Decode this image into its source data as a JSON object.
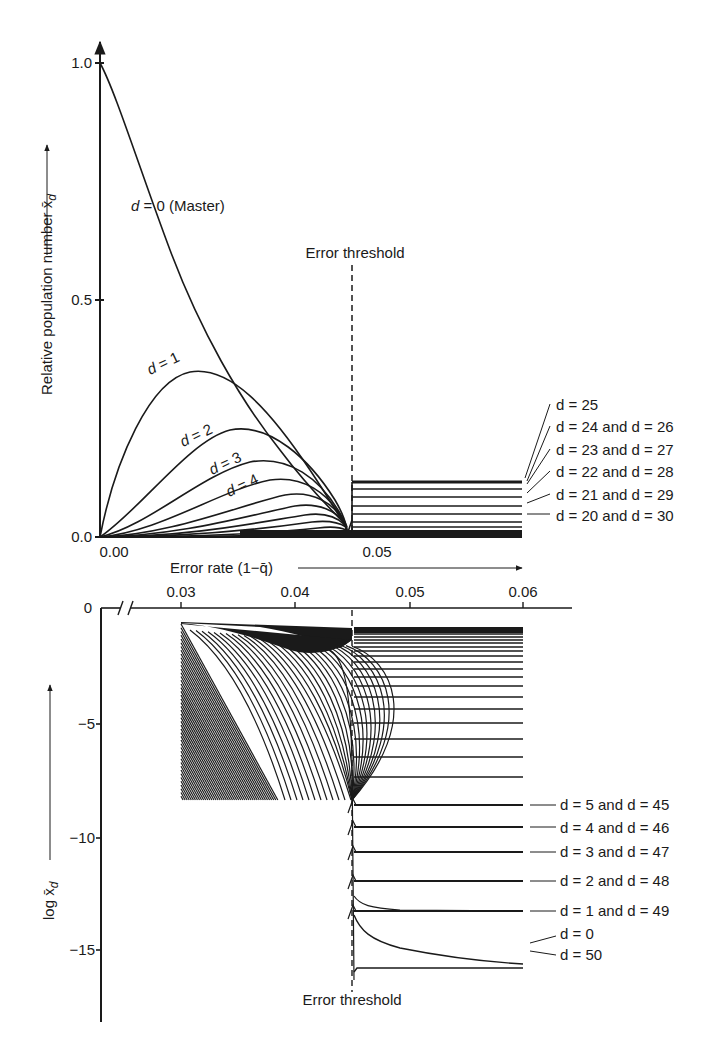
{
  "chart_data": [
    {
      "type": "line",
      "panel": "upper",
      "title": "",
      "xlabel": "Error rate (1−q̄)",
      "ylabel": "Relative population number x̄_d",
      "xlim": [
        0.0,
        0.06
      ],
      "ylim": [
        0.0,
        1.05
      ],
      "x_ticks": [
        "0.00",
        "0.05"
      ],
      "y_ticks": [
        "0.0",
        "0.5",
        "1.0"
      ],
      "grid": false,
      "annotations": [
        "Error threshold",
        "d = 0 (Master)",
        "d = 1",
        "d = 2",
        "d = 3",
        "d = 4"
      ],
      "threshold_x": 0.0457,
      "right_labels": [
        "d = 25",
        "d = 24 and d = 26",
        "d = 23 and d = 27",
        "d = 22 and d = 28",
        "d = 21 and d = 29",
        "d = 20 and d = 30"
      ],
      "series": [
        {
          "name": "d = 0 (Master)",
          "x": [
            0.0,
            0.005,
            0.01,
            0.015,
            0.02,
            0.025,
            0.03,
            0.035,
            0.04,
            0.043,
            0.045
          ],
          "values": [
            1.0,
            0.78,
            0.6,
            0.46,
            0.35,
            0.25,
            0.17,
            0.1,
            0.05,
            0.03,
            0.01
          ]
        },
        {
          "name": "d = 1",
          "x": [
            0.0,
            0.005,
            0.01,
            0.015,
            0.02,
            0.025,
            0.03,
            0.035,
            0.04,
            0.045
          ],
          "values": [
            0.0,
            0.18,
            0.3,
            0.35,
            0.34,
            0.29,
            0.22,
            0.14,
            0.07,
            0.02
          ]
        },
        {
          "name": "d = 2",
          "x": [
            0.0,
            0.01,
            0.02,
            0.025,
            0.03,
            0.035,
            0.04,
            0.045
          ],
          "values": [
            0.0,
            0.07,
            0.19,
            0.22,
            0.21,
            0.17,
            0.1,
            0.03
          ]
        },
        {
          "name": "d = 3",
          "x": [
            0.0,
            0.01,
            0.02,
            0.025,
            0.03,
            0.035,
            0.04,
            0.045
          ],
          "values": [
            0.0,
            0.02,
            0.1,
            0.14,
            0.155,
            0.14,
            0.09,
            0.03
          ]
        },
        {
          "name": "d = 4",
          "x": [
            0.0,
            0.01,
            0.02,
            0.03,
            0.035,
            0.04,
            0.045
          ],
          "values": [
            0.0,
            0.005,
            0.05,
            0.1,
            0.11,
            0.09,
            0.03
          ]
        },
        {
          "name": "d = 25 (above threshold)",
          "x": [
            0.0457,
            0.06
          ],
          "values": [
            0.115,
            0.115
          ]
        },
        {
          "name": "d = 24 and d = 26 (above threshold)",
          "x": [
            0.0457,
            0.06
          ],
          "values": [
            0.108,
            0.108
          ]
        },
        {
          "name": "d = 23 and d = 27 (above threshold)",
          "x": [
            0.0457,
            0.06
          ],
          "values": [
            0.087,
            0.087
          ]
        },
        {
          "name": "d = 22 and d = 28 (above threshold)",
          "x": [
            0.0457,
            0.06
          ],
          "values": [
            0.065,
            0.065
          ]
        },
        {
          "name": "d = 21 and d = 29 (above threshold)",
          "x": [
            0.0457,
            0.06
          ],
          "values": [
            0.045,
            0.045
          ]
        },
        {
          "name": "d = 20 and d = 30 (above threshold)",
          "x": [
            0.0457,
            0.06
          ],
          "values": [
            0.028,
            0.028
          ]
        }
      ]
    },
    {
      "type": "line",
      "panel": "lower",
      "title": "",
      "xlabel": "Error rate (1−q̄)",
      "ylabel": "log x̄_d",
      "xlim": [
        0.0,
        0.063
      ],
      "ylim": [
        -17,
        0
      ],
      "x_ticks": [
        "0.03",
        "0.04",
        "0.05",
        "0.06"
      ],
      "y_ticks": [
        "0",
        "−5",
        "−10",
        "−15"
      ],
      "axis_break": true,
      "grid": false,
      "annotations": [
        "Error threshold"
      ],
      "threshold_x": 0.0457,
      "right_labels": [
        "d = 5 and d = 45",
        "d = 4 and d = 46",
        "d = 3 and d = 47",
        "d = 2 and d = 48",
        "d = 1 and d = 49",
        "d = 0",
        "d = 50"
      ],
      "series": [
        {
          "name": "d = 25",
          "x": [
            0.0457,
            0.06
          ],
          "values": [
            -0.9,
            -0.9
          ]
        },
        {
          "name": "d = 5 and d = 45",
          "x": [
            0.0457,
            0.06
          ],
          "values": [
            -8.6,
            -8.6
          ]
        },
        {
          "name": "d = 4 and d = 46",
          "x": [
            0.0457,
            0.06
          ],
          "values": [
            -9.6,
            -9.6
          ]
        },
        {
          "name": "d = 3 and d = 47",
          "x": [
            0.0457,
            0.06
          ],
          "values": [
            -10.7,
            -10.7
          ]
        },
        {
          "name": "d = 2 and d = 48",
          "x": [
            0.0457,
            0.06
          ],
          "values": [
            -11.9,
            -11.9
          ]
        },
        {
          "name": "d = 1 and d = 49",
          "x": [
            0.0457,
            0.06
          ],
          "values": [
            -13.3,
            -13.3
          ]
        },
        {
          "name": "d = 0",
          "x": [
            0.0457,
            0.048,
            0.052,
            0.056,
            0.06
          ],
          "values": [
            -12.0,
            -13.6,
            -14.2,
            -14.5,
            -14.7
          ]
        },
        {
          "name": "d = 50",
          "x": [
            0.0457,
            0.06
          ],
          "values": [
            -15.0,
            -15.0
          ]
        }
      ]
    }
  ],
  "upper": {
    "y_ticks": [
      "1.0",
      "0.5",
      "0.0"
    ],
    "x_ticks": [
      "0.00",
      "0.05"
    ],
    "ylabel": "Relative population number x̄",
    "ylabel_sub": "d",
    "threshold_label": "Error threshold",
    "master_label": "d = 0 (Master)",
    "curve_labels": [
      "d = 1",
      "d = 2",
      "d = 3",
      "d = 4"
    ],
    "right_labels": [
      "d = 25",
      "d = 24 and d = 26",
      "d = 23 and d = 27",
      "d = 22 and d = 28",
      "d = 21 and d = 29",
      "d = 20 and d = 30"
    ]
  },
  "xaxis_label": "Error rate (1−q̄)",
  "lower": {
    "x_ticks": [
      "0.03",
      "0.04",
      "0.05",
      "0.06"
    ],
    "y_ticks": [
      "0",
      "−5",
      "−10",
      "−15"
    ],
    "ylabel": "log x̄",
    "ylabel_sub": "d",
    "threshold_label": "Error threshold",
    "right_labels": [
      "d = 5 and d = 45",
      "d = 4 and d = 46",
      "d = 3 and d = 47",
      "d = 2 and d = 48",
      "d = 1 and d = 49",
      "d = 0",
      "d = 50"
    ]
  },
  "colors": {
    "ink": "#1a1a1a",
    "background": "#ffffff"
  }
}
